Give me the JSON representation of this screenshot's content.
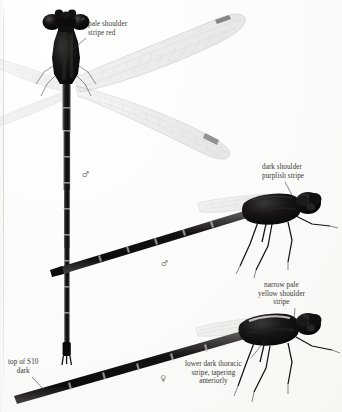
{
  "plate": {
    "kind": "book-plate-photograph",
    "subject": "damselfly specimens",
    "background_color": "#fdfdfc",
    "ink_color": "#2c2a28"
  },
  "annotations": [
    {
      "id": "pale-shoulder-stripe-red",
      "text": "pale shoulder\nstripe red",
      "x": 88,
      "y": 20,
      "align": "left",
      "leader": {
        "x1": 86,
        "y1": 38,
        "x2": 70,
        "y2": 52
      }
    },
    {
      "id": "dark-shoulder-purplish-stripe",
      "text": "dark shoulder\npurplish stripe",
      "x": 262,
      "y": 163,
      "align": "left",
      "leader": {
        "x1": 285,
        "y1": 182,
        "x2": 293,
        "y2": 197
      }
    },
    {
      "id": "narrow-pale-yellow-shoulder-stripe",
      "text": "narrow pale\nyellow shoulder\nstripe",
      "x": 258,
      "y": 281,
      "align": "center",
      "leader": {
        "x1": 295,
        "y1": 308,
        "x2": 294,
        "y2": 320
      }
    },
    {
      "id": "top-of-s10-dark",
      "text": "top of S10\ndark",
      "x": 8,
      "y": 358,
      "align": "center",
      "leader": {
        "x1": 32,
        "y1": 377,
        "x2": 44,
        "y2": 390
      }
    },
    {
      "id": "lower-dark-thoracic-stripe",
      "text": "lower dark thoracic\nstripe, tapering\nanteriorly",
      "x": 185,
      "y": 360,
      "align": "center",
      "leader": {
        "x1": 251,
        "y1": 358,
        "x2": 265,
        "y2": 341
      }
    }
  ],
  "sex_marks": [
    {
      "id": "male-top",
      "symbol": "♂",
      "x": 82,
      "y": 170
    },
    {
      "id": "male-middle",
      "symbol": "♂",
      "x": 161,
      "y": 259
    },
    {
      "id": "female-bottom",
      "symbol": "♀",
      "x": 160,
      "y": 374
    }
  ],
  "specimens": [
    {
      "id": "specimen-dorsal-male",
      "view": "dorsal",
      "sex": "male",
      "description": "large damselfly, dorsal view, wings spread diagonally, long dark abdomen running down the page"
    },
    {
      "id": "specimen-lateral-male",
      "view": "lateral",
      "sex": "male",
      "description": "damselfly in left lateral view, dark thorax, folded wings, abdomen to the left"
    },
    {
      "id": "specimen-lateral-female",
      "view": "lateral",
      "sex": "female",
      "description": "damselfly in left lateral view, pale shoulder stripe, abdomen to the lower left"
    }
  ]
}
